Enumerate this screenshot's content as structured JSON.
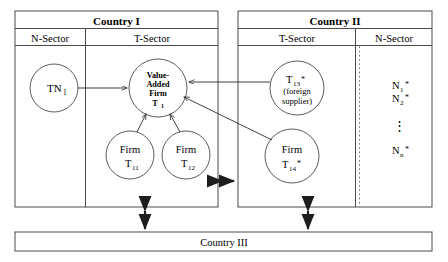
{
  "diagram": {
    "title_country1": "Country I",
    "title_country2": "Country II",
    "title_country3": "Country III",
    "sector_n_label": "N-Sector",
    "sector_t_label": "T-Sector",
    "nodes": {
      "tn1": "TN",
      "tn1_sub": "1",
      "central_l1": "Value-",
      "central_l2": "Added",
      "central_l3": "Firm",
      "central_l4": "T",
      "central_sub": "1",
      "firm_word": "Firm",
      "t11": "T",
      "t11_sub": "11",
      "t12": "T",
      "t12_sub": "12",
      "t13": "T",
      "t13_sub": "13",
      "t13_star": "*",
      "t13_note1": "(foreign",
      "t13_note2": "supplier)",
      "t14": "T",
      "t14_sub": "14",
      "t14_star": "*",
      "n1": "N",
      "n1_sub": "1",
      "n1_star": "*",
      "n2": "N",
      "n2_sub": "2",
      "n2_star": "*",
      "nn": "N",
      "nn_sub": "n",
      "nn_star": "*",
      "vertical_dots": "⋮"
    },
    "colors": {
      "stroke": "#4a4a4a",
      "arrow": "#2b2b2b",
      "text": "#111111",
      "background": "#ffffff"
    }
  }
}
